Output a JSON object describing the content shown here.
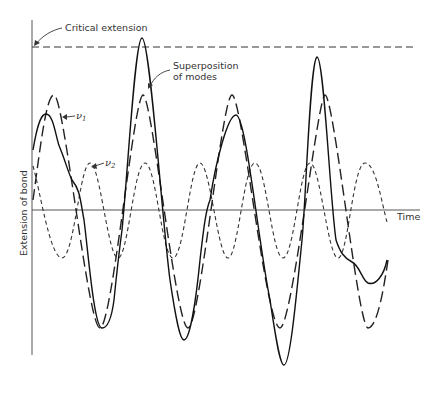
{
  "diagram": {
    "title": "",
    "labels": {
      "critical_extension": "Critical extension",
      "superposition_line1": "Superposition",
      "superposition_line2": "of modes",
      "nu1": "ν",
      "nu1_sub": "1",
      "nu2": "ν",
      "nu2_sub": "2",
      "y_axis": "Extension of bond",
      "x_axis": "Time"
    },
    "series": [
      {
        "name": "ν1",
        "style": "long-dash"
      },
      {
        "name": "ν2",
        "style": "short-dash"
      },
      {
        "name": "Superposition of modes",
        "style": "solid"
      },
      {
        "name": "Critical extension",
        "style": "dashed-horizontal"
      }
    ],
    "colors": {
      "line": "#222222",
      "background": "#ffffff"
    }
  }
}
